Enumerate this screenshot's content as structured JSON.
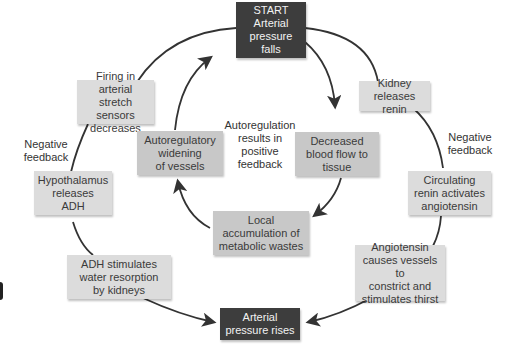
{
  "diagram": {
    "start_box": {
      "title": "START",
      "text": "Arterial\npressure falls"
    },
    "end_box": {
      "text": "Arterial\npressure rises"
    },
    "left_loop": {
      "label": "Negative\nfeedback",
      "steps": [
        {
          "id": "firing",
          "text": "Firing in arterial\nstretch sensors\ndecreases"
        },
        {
          "id": "hypothalamus",
          "text": "Hypothalamus\nreleases\nADH"
        },
        {
          "id": "adh",
          "text": "ADH stimulates\nwater resorption\nby kidneys"
        }
      ]
    },
    "right_loop": {
      "label": "Negative\nfeedback",
      "steps": [
        {
          "id": "kidney",
          "text": "Kidney releases\nrenin"
        },
        {
          "id": "renin",
          "text": "Circulating\nrenin activates\nangiotensin"
        },
        {
          "id": "angiotensin",
          "text": "Angiotensin\ncauses vessels to\nconstrict and\nstimulates thirst"
        }
      ]
    },
    "inner_loop": {
      "label": "Autoregulation\nresults in\npositive\nfeedback",
      "steps": [
        {
          "id": "decreased",
          "text": "Decreased\nblood flow to\ntissue"
        },
        {
          "id": "local",
          "text": "Local\naccumulation of\nmetabolic wastes"
        },
        {
          "id": "widening",
          "text": "Autoregulatory\nwidening\nof vessels"
        }
      ]
    },
    "colors": {
      "dark_box": "#3d3d3d",
      "light_box": "#dcdcdc",
      "mid_box": "#c8c8c8",
      "arrow": "#333333"
    }
  }
}
